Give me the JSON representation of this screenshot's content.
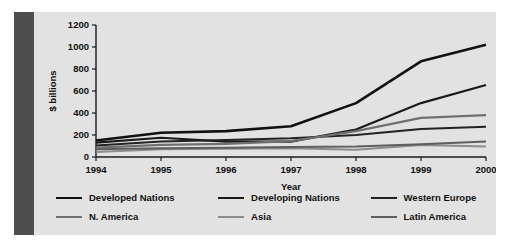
{
  "figure": {
    "background_color": "#e2e2e2",
    "accent_bar_color": "#4e4e4e",
    "page_background": "#ffffff"
  },
  "chart_data": {
    "type": "line",
    "title": "",
    "xlabel": "Year",
    "ylabel": "$ billions",
    "categories": [
      "1994",
      "1995",
      "1996",
      "1997",
      "1998",
      "1999",
      "2000"
    ],
    "x": [
      1994,
      1995,
      1996,
      1997,
      1998,
      1999,
      2000
    ],
    "xlim": [
      1994,
      2000
    ],
    "ylim": [
      0,
      1200
    ],
    "yticks": [
      "0",
      "200",
      "400",
      "600",
      "800",
      "1000",
      "1200"
    ],
    "ytick_values": [
      0,
      200,
      400,
      600,
      800,
      1000,
      1200
    ],
    "grid": false,
    "legend_position": "bottom",
    "series": [
      {
        "name": "Developed Nations",
        "color": "#111111",
        "width": 2.6,
        "values": [
          150,
          220,
          235,
          280,
          490,
          870,
          1020
        ]
      },
      {
        "name": "Developing Nations",
        "color": "#1a1a1a",
        "width": 2.2,
        "values": [
          130,
          175,
          140,
          140,
          250,
          490,
          655
        ]
      },
      {
        "name": "Western Europe",
        "color": "#222222",
        "width": 2.0,
        "values": [
          105,
          140,
          155,
          170,
          200,
          255,
          275
        ]
      },
      {
        "name": "N. America",
        "color": "#707070",
        "width": 2.2,
        "values": [
          85,
          110,
          120,
          145,
          235,
          355,
          380
        ]
      },
      {
        "name": "Asia",
        "color": "#8c8c8c",
        "width": 2.0,
        "values": [
          45,
          70,
          75,
          80,
          65,
          110,
          95
        ]
      },
      {
        "name": "Latin America",
        "color": "#5e5e5e",
        "width": 2.0,
        "values": [
          70,
          80,
          85,
          90,
          95,
          115,
          140
        ]
      }
    ]
  },
  "legend": {
    "rows": [
      [
        {
          "label": "Developed Nations",
          "color": "#111111",
          "width": 2.6
        },
        {
          "label": "Developing Nations",
          "color": "#1a1a1a",
          "width": 2.4
        },
        {
          "label": "Western Europe",
          "color": "#222222",
          "width": 2.4
        }
      ],
      [
        {
          "label": "N. America",
          "color": "#707070",
          "width": 2.2
        },
        {
          "label": "Asia",
          "color": "#8c8c8c",
          "width": 2.0
        },
        {
          "label": "Latin America",
          "color": "#5e5e5e",
          "width": 2.2
        }
      ]
    ]
  }
}
